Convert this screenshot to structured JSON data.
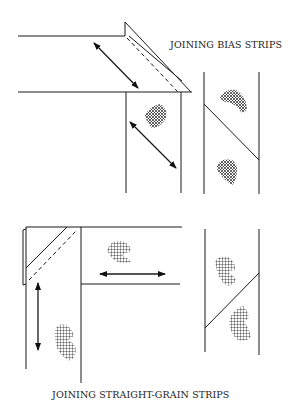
{
  "diagram": {
    "top_title": "JOINING BIAS STRIPS",
    "bottom_title": "JOINING STRAIGHT-GRAIN STRIPS",
    "colors": {
      "line": "#1a1a1a",
      "background": "#ffffff"
    },
    "panels": [
      {
        "id": "bias",
        "label": "JOINING BIAS STRIPS",
        "elements": [
          "horizontal-strip",
          "folded-corner",
          "seam-dashed-line",
          "vertical-strip",
          "grain-arrow-diagonal",
          "fabric-swatch",
          "joined-strip-diagonal-seam"
        ]
      },
      {
        "id": "straight-grain",
        "label": "JOINING STRAIGHT-GRAIN STRIPS",
        "elements": [
          "vertical-strip",
          "folded-corner",
          "seam-dashed-line",
          "horizontal-strip",
          "grain-arrow-vertical",
          "grain-arrow-horizontal",
          "fabric-swatch",
          "joined-strip-diagonal-seam"
        ]
      }
    ]
  }
}
